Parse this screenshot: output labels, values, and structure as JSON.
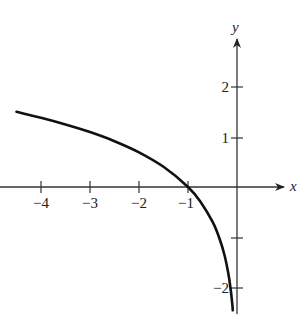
{
  "chart_data": {
    "type": "line",
    "title": "",
    "xlabel": "x",
    "ylabel": "y",
    "function": "y = ln(-x)",
    "xlim": [
      -4.5,
      1
    ],
    "ylim": [
      -2.5,
      3
    ],
    "grid": false,
    "legend": null,
    "x_ticks": [
      -4,
      -3,
      -2,
      -1
    ],
    "x_tick_labels": [
      "−4",
      "−3",
      "−2",
      "−1"
    ],
    "y_ticks": [
      2,
      1,
      -1,
      -2
    ],
    "y_tick_labels": [
      "2",
      "1",
      "",
      "−2"
    ],
    "series": [
      {
        "name": "ln(-x)",
        "x": [
          -4.5,
          -4,
          -3.5,
          -3,
          -2.5,
          -2,
          -1.5,
          -1,
          -0.75,
          -0.5,
          -0.35,
          -0.25,
          -0.18,
          -0.13,
          -0.1,
          -0.085
        ],
        "y": [
          1.504,
          1.386,
          1.253,
          1.099,
          0.916,
          0.693,
          0.405,
          0.0,
          -0.288,
          -0.693,
          -1.05,
          -1.386,
          -1.715,
          -2.04,
          -2.303,
          -2.465
        ]
      }
    ],
    "annotations": []
  },
  "axes": {
    "x_label": "x",
    "y_label": "y",
    "x_ticks": [
      {
        "value": -4,
        "label": "−4"
      },
      {
        "value": -3,
        "label": "−3"
      },
      {
        "value": -2,
        "label": "−2"
      },
      {
        "value": -1,
        "label": "−1"
      }
    ],
    "y_ticks": [
      {
        "value": 2,
        "label": "2"
      },
      {
        "value": 1,
        "label": "1"
      },
      {
        "value": -1,
        "label": ""
      },
      {
        "value": -2,
        "label": "−2"
      }
    ]
  },
  "style": {
    "line_color": "#111111",
    "axis_color": "#333333"
  }
}
